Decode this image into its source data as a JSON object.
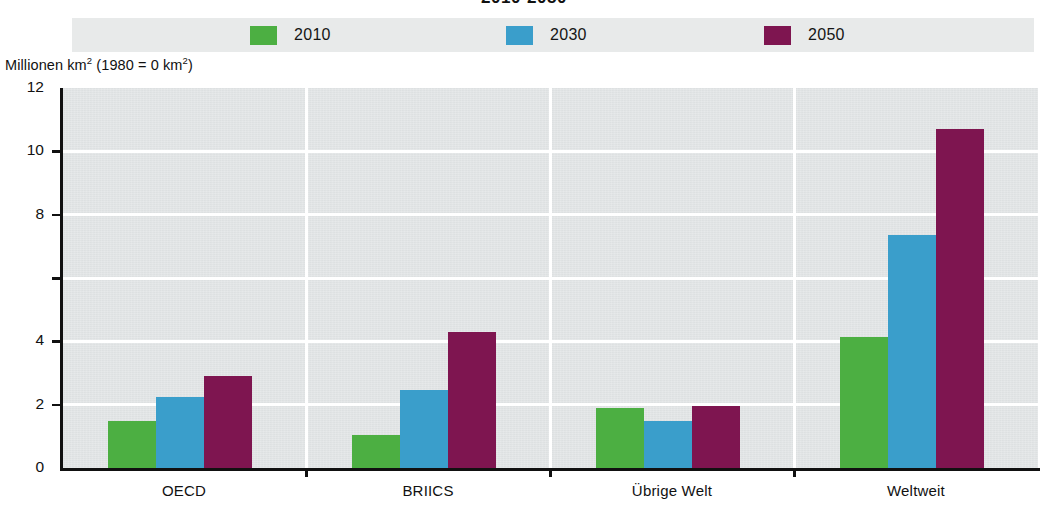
{
  "chart_title": "2010-2050",
  "legend": {
    "items": [
      {
        "label": "2010",
        "color": "#4caf42"
      },
      {
        "label": "2030",
        "color": "#3a9ecb"
      },
      {
        "label": "2050",
        "color": "#7e1550"
      }
    ]
  },
  "y_axis": {
    "title_prefix": "Millionen km",
    "title_sup1": "2",
    "title_mid": " (1980 = 0 km",
    "title_sup2": "2",
    "title_suffix": ")",
    "title_full": "Millionen km² (1980 = 0 km²)",
    "ticks": [
      "12",
      "10",
      "8",
      "",
      "4",
      "2",
      "0"
    ]
  },
  "chart_data": {
    "type": "bar",
    "title": "2010-2050",
    "xlabel": "",
    "ylabel": "Millionen km² (1980 = 0 km²)",
    "ylim": [
      0,
      12
    ],
    "ytick_values": [
      0,
      2,
      4,
      6,
      8,
      10,
      12
    ],
    "ytick_labels": [
      "0",
      "2",
      "4",
      "",
      "8",
      "10",
      "12"
    ],
    "grid": true,
    "legend_position": "top",
    "categories": [
      "OECD",
      "BRIICS",
      "Übrige Welt",
      "Weltweit"
    ],
    "series": [
      {
        "name": "2010",
        "color": "#4caf42",
        "values": [
          1.5,
          1.05,
          1.9,
          4.15
        ]
      },
      {
        "name": "2030",
        "color": "#3a9ecb",
        "values": [
          2.25,
          2.45,
          1.5,
          7.35
        ]
      },
      {
        "name": "2050",
        "color": "#7e1550",
        "values": [
          2.9,
          4.3,
          1.95,
          10.7
        ]
      }
    ]
  },
  "colors": {
    "plot_background": "#e3e6e7",
    "legend_background": "#e8eaea",
    "gridline": "#ffffff",
    "axis": "#111111",
    "page_background": "#ffffff"
  }
}
